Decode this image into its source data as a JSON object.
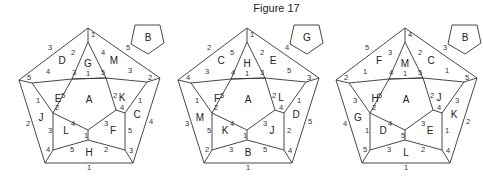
{
  "title": "Figure 17",
  "figures": [
    {
      "id": "fig1",
      "offset_x": 0,
      "small_pentagon_label": "B",
      "faces": {
        "top": "G",
        "upper_left": "D",
        "upper_right": "M",
        "left_mid": "E",
        "right_mid": "K",
        "center": "A",
        "outer_left": "J",
        "outer_right": "C",
        "lower_left": "L",
        "lower_right": "F",
        "bottom": "H"
      },
      "numbers": {
        "apex": "1",
        "outer_top_left": "3",
        "outer_top_right": "5",
        "G_left": "2",
        "G_right": "4",
        "G_bottom": "1",
        "G_bl": "3",
        "G_br": "5",
        "D_left_edge": "4",
        "D_corner": "5",
        "M_right_edge": "3",
        "M_corner": "2",
        "E_right": "5",
        "E_bottom": "2",
        "E_outer": "1",
        "K_left": "2",
        "K_bottom": "4",
        "K_outer": "1",
        "outer_left": "2",
        "outer_right": "4",
        "J_right": "3",
        "J_bottom": "4",
        "C_left": "5",
        "C_bottom": "3",
        "L_top": "4",
        "L_right": "1",
        "L_bottom": "5",
        "F_top": "3",
        "F_bottom": "2",
        "outer_bottom": "1"
      }
    },
    {
      "id": "fig2",
      "offset_x": 159,
      "small_pentagon_label": "G",
      "faces": {
        "top": "H",
        "upper_left": "C",
        "upper_right": "E",
        "left_mid": "F",
        "right_mid": "L",
        "center": "A",
        "outer_left": "M",
        "outer_right": "D",
        "lower_left": "K",
        "lower_right": "J",
        "bottom": "B"
      },
      "numbers": {
        "apex": "1",
        "outer_top_left": "2",
        "outer_top_right": "4",
        "G_left": "5",
        "G_right": "2",
        "G_bottom": "1",
        "G_bl": "4",
        "G_br": "3",
        "D_left_edge": "3",
        "D_corner": "4",
        "M_right_edge": "5",
        "M_corner": "3",
        "E_right": "5",
        "E_bottom": "2",
        "E_outer": "1",
        "K_left": "2",
        "K_bottom": "4",
        "K_outer": "1",
        "outer_left": "3",
        "outer_right": "5",
        "J_right": "5",
        "J_bottom": "2",
        "C_left": "2",
        "C_bottom": "4",
        "L_top": "4",
        "L_right": "1",
        "L_bottom": "3",
        "F_top": "3",
        "F_bottom": "5",
        "outer_bottom": "1"
      }
    },
    {
      "id": "fig3",
      "offset_x": 317,
      "small_pentagon_label": "B",
      "faces": {
        "top": "M",
        "upper_left": "F",
        "upper_right": "C",
        "left_mid": "H",
        "right_mid": "J",
        "center": "A",
        "outer_left": "G",
        "outer_right": "K",
        "lower_left": "D",
        "lower_right": "E",
        "bottom": "L"
      },
      "numbers": {
        "apex": "4",
        "outer_top_left": "5",
        "outer_top_right": "3",
        "G_left": "3",
        "G_right": "2",
        "G_bottom": "1",
        "G_bl": "4",
        "G_br": "5",
        "D_left_edge": "1",
        "D_corner": "2",
        "M_right_edge": "1",
        "M_corner": "5",
        "E_right": "5",
        "E_bottom": "2",
        "E_outer": "3",
        "K_left": "2",
        "K_bottom": "4",
        "K_outer": "3",
        "outer_left": "4",
        "outer_right": "2",
        "J_right": "1",
        "J_bottom": "5",
        "C_left": "1",
        "C_bottom": "4",
        "L_top": "4",
        "L_right": "5",
        "L_bottom": "3",
        "F_top": "3",
        "F_bottom": "2",
        "outer_bottom": "1"
      }
    }
  ]
}
